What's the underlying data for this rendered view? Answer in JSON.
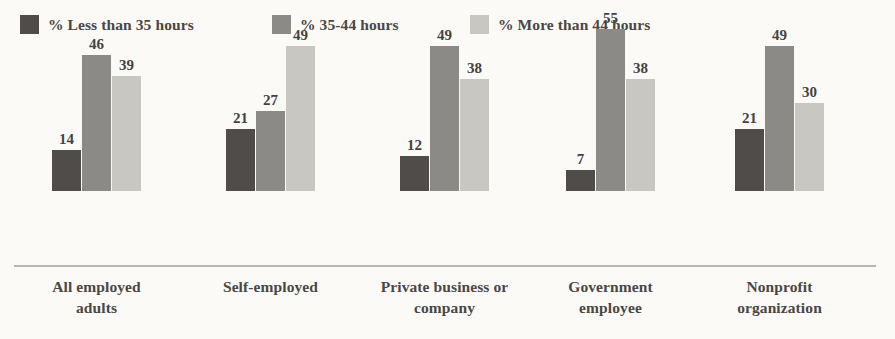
{
  "chart_data": {
    "type": "bar",
    "title": "",
    "subtitle": "",
    "xlabel": "",
    "ylabel": "",
    "ylim": [
      0,
      60
    ],
    "grid": false,
    "legend_position": "top-left",
    "value_labels": true,
    "categories": [
      "All employed adults",
      "Self-employed",
      "Private business or company",
      "Government employee",
      "Nonprofit organization"
    ],
    "category_lines": [
      [
        "All employed",
        "adults"
      ],
      [
        "Self-employed",
        ""
      ],
      [
        "Private business or",
        "company"
      ],
      [
        "Government",
        "employee"
      ],
      [
        "Nonprofit",
        "organization"
      ]
    ],
    "series": [
      {
        "name": "% Less than 35 hours",
        "color": "#4f4c4a",
        "values": [
          14,
          21,
          12,
          7,
          21
        ]
      },
      {
        "name": "% 35-44 hours",
        "color": "#8c8a86",
        "values": [
          46,
          27,
          49,
          55,
          49
        ]
      },
      {
        "name": "% More than 44 hours",
        "color": "#c9c7c2",
        "values": [
          39,
          49,
          38,
          38,
          30
        ]
      }
    ]
  },
  "legend": {
    "items": [
      {
        "label": "% Less than 35 hours",
        "color": "#4f4c4a",
        "x": 20
      },
      {
        "label": "% 35-44 hours",
        "color": "#8c8a86",
        "x": 272
      },
      {
        "label": "% More than 44 hours",
        "color": "#c9c7c2",
        "x": 470
      }
    ]
  },
  "axis": {
    "baseline_color": "#b9b5ad"
  },
  "layout": {
    "group_starts": [
      52,
      226,
      400,
      566,
      735
    ],
    "bar_width": 29,
    "bar_gap": 1,
    "baseline_y": 265,
    "px_per_unit": 2.95,
    "group_label_width": 160
  }
}
